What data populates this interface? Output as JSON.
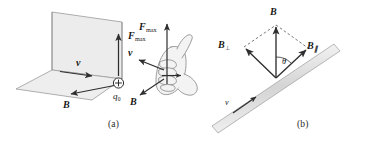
{
  "figure": {
    "background_color": "#ffffff",
    "stroke_color": "#3a3a3a",
    "plane_fill": "#ebebeb",
    "plane_fill_2": "#e4e4e4",
    "rod_fill": "#d8d8d8",
    "width": 371,
    "height": 145
  },
  "panel_a": {
    "caption": "(a)",
    "labels": {
      "force_plane": "F",
      "force_plane_sub": "max",
      "velocity": "v",
      "field": "B",
      "charge": "q",
      "charge_sub": "0",
      "force_hand": "F",
      "force_hand_sub": "max",
      "velocity_hand": "v",
      "field_hand": "B"
    },
    "icons": {
      "charge_marker": "plus-circle-icon",
      "hand": "right-hand-icon",
      "vertical_plane": "plane-icon",
      "horizontal_plane": "plane-icon"
    }
  },
  "panel_b": {
    "caption": "(b)",
    "labels": {
      "field": "B",
      "field_perp": "B",
      "field_perp_sub": "⊥",
      "field_parallel": "B",
      "field_parallel_sub": "∥",
      "angle": "θ",
      "velocity": "v"
    },
    "icons": {
      "rod": "inclined-rod-icon",
      "parallelogram": "dashed-parallelogram-icon"
    }
  }
}
